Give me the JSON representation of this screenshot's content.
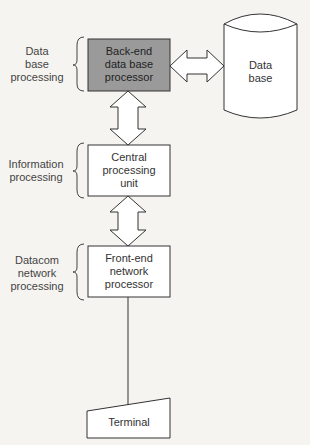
{
  "diagram": {
    "type": "architecture",
    "colors": {
      "backend_fill": "#9a9a9a",
      "stroke": "#333333",
      "background": "#f6f4f1"
    },
    "side_labels": [
      {
        "id": "db-processing",
        "lines": [
          "Data",
          "base",
          "processing"
        ]
      },
      {
        "id": "info-processing",
        "lines": [
          "Information",
          "processing"
        ]
      },
      {
        "id": "datacom-processing",
        "lines": [
          "Datacom",
          "network",
          "processing"
        ]
      }
    ],
    "nodes": [
      {
        "id": "backend",
        "lines": [
          "Back-end",
          "data base",
          "processor"
        ]
      },
      {
        "id": "cpu",
        "lines": [
          "Central",
          "processing",
          "unit"
        ]
      },
      {
        "id": "frontend",
        "lines": [
          "Front-end",
          "network",
          "processor"
        ]
      },
      {
        "id": "terminal",
        "lines": [
          "Terminal"
        ]
      },
      {
        "id": "database",
        "lines": [
          "Data",
          "base"
        ]
      }
    ],
    "edges": [
      {
        "from": "backend",
        "to": "database",
        "style": "double-arrow"
      },
      {
        "from": "backend",
        "to": "cpu",
        "style": "double-arrow"
      },
      {
        "from": "cpu",
        "to": "frontend",
        "style": "double-arrow"
      },
      {
        "from": "frontend",
        "to": "terminal",
        "style": "line"
      }
    ]
  }
}
